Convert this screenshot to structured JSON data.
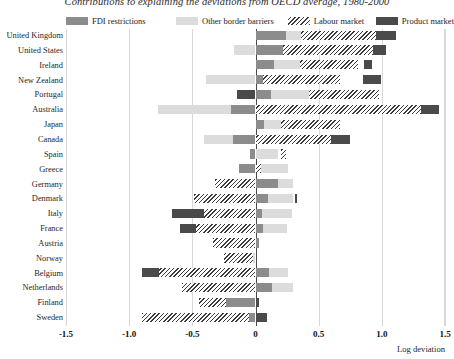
{
  "chart_data": {
    "type": "bar",
    "orientation": "horizontal",
    "stacked": true,
    "title": "Contributions to explaining the deviations from OECD average, 1980-2000",
    "xlabel": "Log deviation",
    "ylabel": "",
    "xlim": [
      -1.5,
      1.5
    ],
    "xticks": [
      -1.5,
      -1.0,
      -0.5,
      0,
      0.5,
      1.0,
      1.5
    ],
    "xticklabels": [
      "-1.5",
      "-1.0",
      "-0.5",
      "0",
      "0.5",
      "1.0",
      "1.5"
    ],
    "grid": true,
    "legend_position": "top",
    "legend": [
      "FDI restrictions",
      "Other border barriers",
      "Labour market",
      "Product market"
    ],
    "colors": {
      "fdi_restrictions": "#8c8c8c",
      "other_border_barriers": "#dcdcdc",
      "labour_market": "#ffffff",
      "labour_market_hatch": "#3b3b3b",
      "product_market": "#4a4a4a",
      "gridline": "#d8d8d8",
      "zeroline": "#4a4a4a"
    },
    "categories": [
      "United Kingdom",
      "United States",
      "Ireland",
      "New Zealand",
      "Portugal",
      "Australia",
      "Japan",
      "Canada",
      "Spain",
      "Greece",
      "Germany",
      "Denmark",
      "Italy",
      "France",
      "Austria",
      "Norway",
      "Belgium",
      "Netherlands",
      "Finland",
      "Sweden"
    ],
    "series": [
      {
        "name": "FDI restrictions",
        "values": [
          0.24,
          0.22,
          0.15,
          0.06,
          0.12,
          0.19,
          0.07,
          0.18,
          -0.04,
          -0.13,
          0.18,
          0.1,
          0.05,
          0.06,
          0.03,
          0.0,
          0.11,
          0.13,
          0.23,
          0.05
        ]
      },
      {
        "name": "Other border barriers",
        "values": [
          0.12,
          -0.17,
          0.2,
          -0.39,
          0.3,
          -0.58,
          0.13,
          -0.23,
          0.09,
          0.22,
          0.12,
          0.2,
          0.24,
          0.19,
          0.01,
          -0.02,
          0.15,
          0.17,
          0.0,
          0.0
        ]
      },
      {
        "name": "Labour market",
        "values": [
          0.59,
          0.71,
          0.46,
          0.61,
          0.56,
          1.31,
          0.47,
          0.72,
          0.02,
          0.02,
          -0.32,
          -0.49,
          -0.4,
          -0.26,
          -0.34,
          -0.25,
          -0.54,
          -0.58,
          -0.45,
          -0.9
        ]
      },
      {
        "name": "Product market",
        "values": [
          0.16,
          0.1,
          0.06,
          0.1,
          0.0,
          0.14,
          0.0,
          0.15,
          0.0,
          0.0,
          0.0,
          0.02,
          0.0,
          0.0,
          0.0,
          0.0,
          0.0,
          0.0,
          0.0,
          0.09
        ]
      }
    ],
    "bars": [
      {
        "category": "United Kingdom",
        "segments": [
          {
            "series": "FDI restrictions",
            "start": 0.0,
            "end": 0.24
          },
          {
            "series": "Other border barriers",
            "start": 0.24,
            "end": 0.36
          },
          {
            "series": "Labour market",
            "start": 0.36,
            "end": 0.95
          },
          {
            "series": "Product market",
            "start": 0.95,
            "end": 1.11
          }
        ]
      },
      {
        "category": "United States",
        "segments": [
          {
            "series": "Other border barriers",
            "start": -0.17,
            "end": 0.0
          },
          {
            "series": "FDI restrictions",
            "start": 0.0,
            "end": 0.22
          },
          {
            "series": "Labour market",
            "start": 0.22,
            "end": 0.93
          },
          {
            "series": "Product market",
            "start": 0.93,
            "end": 1.03
          }
        ]
      },
      {
        "category": "Ireland",
        "segments": [
          {
            "series": "FDI restrictions",
            "start": 0.0,
            "end": 0.15
          },
          {
            "series": "Other border barriers",
            "start": 0.15,
            "end": 0.35
          },
          {
            "series": "Labour market",
            "start": 0.35,
            "end": 0.81
          },
          {
            "series": "Product market",
            "start": 0.86,
            "end": 0.92
          }
        ]
      },
      {
        "category": "New Zealand",
        "segments": [
          {
            "series": "Other border barriers",
            "start": -0.39,
            "end": 0.0
          },
          {
            "series": "FDI restrictions",
            "start": 0.0,
            "end": 0.06
          },
          {
            "series": "Labour market",
            "start": 0.06,
            "end": 0.67
          },
          {
            "series": "Product market",
            "start": 0.85,
            "end": 0.99
          }
        ]
      },
      {
        "category": "Portugal",
        "segments": [
          {
            "series": "Product market",
            "start": -0.15,
            "end": 0.0
          },
          {
            "series": "FDI restrictions",
            "start": 0.0,
            "end": 0.12
          },
          {
            "series": "Other border barriers",
            "start": 0.12,
            "end": 0.42
          },
          {
            "series": "Labour market",
            "start": 0.42,
            "end": 0.98
          }
        ]
      },
      {
        "category": "Australia",
        "segments": [
          {
            "series": "Other border barriers",
            "start": -0.77,
            "end": -0.19
          },
          {
            "series": "FDI restrictions",
            "start": -0.19,
            "end": 0.0
          },
          {
            "series": "Labour market",
            "start": 0.0,
            "end": 1.31
          },
          {
            "series": "Product market",
            "start": 1.31,
            "end": 1.45
          }
        ]
      },
      {
        "category": "Japan",
        "segments": [
          {
            "series": "FDI restrictions",
            "start": 0.0,
            "end": 0.07
          },
          {
            "series": "Other border barriers",
            "start": 0.07,
            "end": 0.2
          },
          {
            "series": "Labour market",
            "start": 0.2,
            "end": 0.67
          }
        ]
      },
      {
        "category": "Canada",
        "segments": [
          {
            "series": "Other border barriers",
            "start": -0.41,
            "end": -0.18
          },
          {
            "series": "FDI restrictions",
            "start": -0.18,
            "end": 0.0
          },
          {
            "series": "Labour market",
            "start": 0.0,
            "end": 0.6
          },
          {
            "series": "Product market",
            "start": 0.6,
            "end": 0.75
          }
        ]
      },
      {
        "category": "Spain",
        "segments": [
          {
            "series": "FDI restrictions",
            "start": -0.04,
            "end": 0.0
          },
          {
            "series": "Other border barriers",
            "start": 0.0,
            "end": 0.18
          },
          {
            "series": "Labour market",
            "start": 0.2,
            "end": 0.24
          }
        ]
      },
      {
        "category": "Greece",
        "segments": [
          {
            "series": "FDI restrictions",
            "start": -0.13,
            "end": 0.0
          },
          {
            "series": "Labour market",
            "start": 0.0,
            "end": 0.04
          },
          {
            "series": "Other border barriers",
            "start": 0.04,
            "end": 0.26
          }
        ]
      },
      {
        "category": "Germany",
        "segments": [
          {
            "series": "Labour market",
            "start": -0.32,
            "end": 0.0
          },
          {
            "series": "FDI restrictions",
            "start": 0.0,
            "end": 0.18
          },
          {
            "series": "Other border barriers",
            "start": 0.18,
            "end": 0.3
          }
        ]
      },
      {
        "category": "Denmark",
        "segments": [
          {
            "series": "Labour market",
            "start": -0.49,
            "end": 0.0
          },
          {
            "series": "FDI restrictions",
            "start": 0.0,
            "end": 0.1
          },
          {
            "series": "Other border barriers",
            "start": 0.1,
            "end": 0.3
          },
          {
            "series": "Product market",
            "start": 0.31,
            "end": 0.33
          }
        ]
      },
      {
        "category": "Italy",
        "segments": [
          {
            "series": "Product market",
            "start": -0.66,
            "end": -0.41
          },
          {
            "series": "Labour market",
            "start": -0.41,
            "end": 0.0
          },
          {
            "series": "FDI restrictions",
            "start": 0.0,
            "end": 0.05
          },
          {
            "series": "Other border barriers",
            "start": 0.05,
            "end": 0.29
          }
        ]
      },
      {
        "category": "France",
        "segments": [
          {
            "series": "Product market",
            "start": -0.6,
            "end": -0.47
          },
          {
            "series": "Labour market",
            "start": -0.47,
            "end": 0.0
          },
          {
            "series": "FDI restrictions",
            "start": 0.0,
            "end": 0.06
          },
          {
            "series": "Other border barriers",
            "start": 0.06,
            "end": 0.25
          }
        ]
      },
      {
        "category": "Austria",
        "segments": [
          {
            "series": "Labour market",
            "start": -0.34,
            "end": 0.0
          },
          {
            "series": "FDI restrictions",
            "start": 0.0,
            "end": 0.03
          }
        ]
      },
      {
        "category": "Norway",
        "segments": [
          {
            "series": "Labour market",
            "start": -0.25,
            "end": 0.0
          },
          {
            "series": "Other border barriers",
            "start": -0.02,
            "end": 0.0
          }
        ]
      },
      {
        "category": "Belgium",
        "segments": [
          {
            "series": "Product market",
            "start": -0.9,
            "end": -0.76
          },
          {
            "series": "Labour market",
            "start": -0.76,
            "end": 0.0
          },
          {
            "series": "FDI restrictions",
            "start": 0.0,
            "end": 0.11
          },
          {
            "series": "Other border barriers",
            "start": 0.11,
            "end": 0.26
          }
        ]
      },
      {
        "category": "Netherlands",
        "segments": [
          {
            "series": "Labour market",
            "start": -0.58,
            "end": 0.0
          },
          {
            "series": "FDI restrictions",
            "start": 0.0,
            "end": 0.13
          },
          {
            "series": "Other border barriers",
            "start": 0.13,
            "end": 0.3
          }
        ]
      },
      {
        "category": "Finland",
        "segments": [
          {
            "series": "Labour market",
            "start": -0.45,
            "end": -0.23
          },
          {
            "series": "FDI restrictions",
            "start": -0.23,
            "end": 0.0
          },
          {
            "series": "Product market",
            "start": 0.01,
            "end": 0.03
          }
        ]
      },
      {
        "category": "Sweden",
        "segments": [
          {
            "series": "Labour market",
            "start": -0.9,
            "end": -0.05
          },
          {
            "series": "FDI restrictions",
            "start": -0.05,
            "end": 0.0
          },
          {
            "series": "Product market",
            "start": 0.0,
            "end": 0.09
          }
        ]
      }
    ]
  }
}
